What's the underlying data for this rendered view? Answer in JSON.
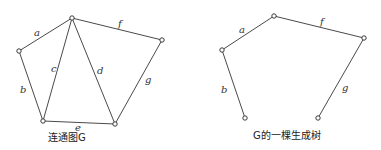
{
  "left_graph": {
    "caption": "连通图G",
    "nodes": [
      {
        "id": "top",
        "x": 72,
        "y": 18
      },
      {
        "id": "left",
        "x": 19,
        "y": 51
      },
      {
        "id": "bottom_left",
        "x": 43,
        "y": 121
      },
      {
        "id": "bottom_right",
        "x": 115,
        "y": 124
      },
      {
        "id": "right",
        "x": 162,
        "y": 40
      }
    ],
    "edges": [
      {
        "label": "a",
        "from": "left",
        "to": "top"
      },
      {
        "label": "b",
        "from": "left",
        "to": "bottom_left"
      },
      {
        "label": "c",
        "from": "bottom_left",
        "to": "top"
      },
      {
        "label": "d",
        "from": "top",
        "to": "bottom_right"
      },
      {
        "label": "e",
        "from": "bottom_left",
        "to": "bottom_right"
      },
      {
        "label": "f",
        "from": "top",
        "to": "right"
      },
      {
        "label": "g",
        "from": "right",
        "to": "bottom_right"
      }
    ]
  },
  "right_graph": {
    "caption": "G的一棵生成树",
    "nodes": [
      {
        "id": "top",
        "x": 274,
        "y": 16
      },
      {
        "id": "left",
        "x": 222,
        "y": 50
      },
      {
        "id": "bottom_left",
        "x": 245,
        "y": 118
      },
      {
        "id": "bottom_right",
        "x": 318,
        "y": 118
      },
      {
        "id": "right",
        "x": 364,
        "y": 38
      }
    ],
    "edges": [
      {
        "label": "a",
        "from": "left",
        "to": "top"
      },
      {
        "label": "b",
        "from": "left",
        "to": "bottom_left"
      },
      {
        "label": "f",
        "from": "top",
        "to": "right"
      },
      {
        "label": "g",
        "from": "right",
        "to": "bottom_right"
      }
    ]
  },
  "labels": {
    "a": "a",
    "b": "b",
    "c": "c",
    "d": "d",
    "e": "e",
    "f": "f",
    "g": "g"
  }
}
